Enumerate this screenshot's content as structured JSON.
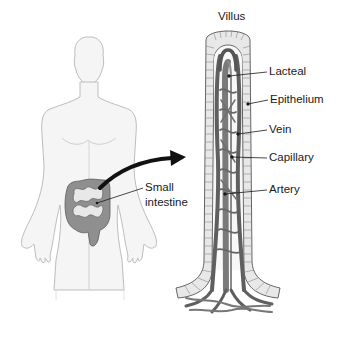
{
  "diagram": {
    "type": "anatomical-illustration"
  },
  "figure": {
    "name": "human-body-outline",
    "highlighted_organ": "Small intestine"
  },
  "labels": {
    "villus_title": "Villus",
    "lacteal": "Lacteal",
    "epithelium": "Epithelium",
    "vein": "Vein",
    "capillary": "Capillary",
    "artery": "Artery",
    "small_intestine_line1": "Small",
    "small_intestine_line2": "intestine"
  },
  "colors": {
    "body_outline": "#b8b8b8",
    "body_fill": "#f4f4f4",
    "intestine_fill": "#8e8e8e",
    "vessel_fill": "#6e6e6e",
    "vessel_dark": "#444444",
    "epithelium_fill": "#e6e6e6",
    "text": "#1a1a1a"
  }
}
